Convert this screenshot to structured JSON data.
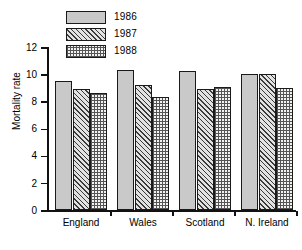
{
  "chart_data": {
    "type": "bar",
    "title": "",
    "subtitle": "",
    "xlabel": "",
    "ylabel": "Mortality rate",
    "categories": [
      "England",
      "Wales",
      "Scotland",
      "N. Ireland"
    ],
    "series": [
      {
        "name": "1986",
        "pattern": "solid",
        "values": [
          9.5,
          10.3,
          10.2,
          10.0
        ]
      },
      {
        "name": "1987",
        "pattern": "hatch",
        "values": [
          8.9,
          9.2,
          8.9,
          10.0
        ]
      },
      {
        "name": "1988",
        "pattern": "dots",
        "values": [
          8.65,
          8.3,
          9.05,
          9.0
        ]
      }
    ],
    "ylim": [
      0,
      12
    ],
    "y_ticks": [
      0,
      2,
      4,
      6,
      8,
      10,
      12
    ],
    "y_tick_labels": [
      "0",
      "2",
      "4",
      "6",
      "8",
      "10",
      "12"
    ],
    "grid": false,
    "legend_position": "top-left",
    "colors": {
      "series_1986": "#c9c9c9",
      "series_1987": "#e2e2e2",
      "series_1988": "#f2f2f2",
      "outline": "#1a1a1a",
      "axis": "#111111",
      "background": "#ffffff"
    }
  },
  "legend": {
    "entries": [
      {
        "label": "1986"
      },
      {
        "label": "1987"
      },
      {
        "label": "1988"
      }
    ]
  }
}
